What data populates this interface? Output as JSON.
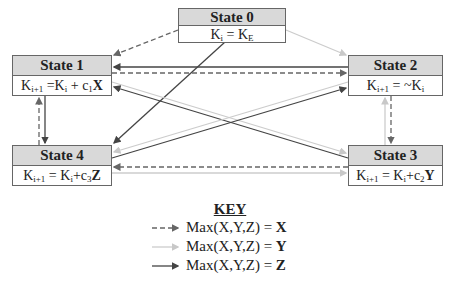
{
  "states": [
    {
      "id": "state-0",
      "title": "State 0",
      "formula": {
        "lhs": "K",
        "lhs_sub": "i",
        "op": " = ",
        "rhs": "K",
        "rhs_sub": "E",
        "coef": "",
        "coef_sub": "",
        "var": ""
      }
    },
    {
      "id": "state-1",
      "title": "State 1",
      "formula": {
        "lhs": "K",
        "lhs_sub": "i+1",
        "op": " =",
        "rhs": "K",
        "rhs_sub": "i",
        "plus": " + c",
        "coef_sub": "1",
        "var": "X"
      }
    },
    {
      "id": "state-2",
      "title": "State 2",
      "formula": {
        "lhs": "K",
        "lhs_sub": "i+1",
        "op": " = ~",
        "rhs": "K",
        "rhs_sub": "i",
        "plus": "",
        "coef_sub": "",
        "var": ""
      }
    },
    {
      "id": "state-3",
      "title": "State 3",
      "formula": {
        "lhs": "K",
        "lhs_sub": "i+1",
        "op": " = ",
        "rhs": "K",
        "rhs_sub": "i",
        "plus": "+c",
        "coef_sub": "2",
        "var": "Y"
      }
    },
    {
      "id": "state-4",
      "title": "State 4",
      "formula": {
        "lhs": "K",
        "lhs_sub": "i+1",
        "op": " = ",
        "rhs": "K",
        "rhs_sub": "i",
        "plus": "+c",
        "coef_sub": "3",
        "var": "Z"
      }
    }
  ],
  "transitions": [
    {
      "from": "State 0",
      "to": "State 1",
      "type": "X"
    },
    {
      "from": "State 0",
      "to": "State 2",
      "type": "Y"
    },
    {
      "from": "State 0",
      "to": "State 4",
      "type": "Z"
    },
    {
      "from": "State 2",
      "to": "State 1",
      "type": "Z"
    },
    {
      "from": "State 1",
      "to": "State 2",
      "type": "X"
    },
    {
      "from": "State 1",
      "to": "State 3",
      "type": "Y"
    },
    {
      "from": "State 3",
      "to": "State 1",
      "type": "Z"
    },
    {
      "from": "State 2",
      "to": "State 4",
      "type": "Y"
    },
    {
      "from": "State 4",
      "to": "State 2",
      "type": "Z"
    },
    {
      "from": "State 1",
      "to": "State 4",
      "type": "Z"
    },
    {
      "from": "State 4",
      "to": "State 1",
      "type": "X"
    },
    {
      "from": "State 2",
      "to": "State 3",
      "type": "X"
    },
    {
      "from": "State 3",
      "to": "State 2",
      "type": "Y"
    },
    {
      "from": "State 3",
      "to": "State 4",
      "type": "X"
    },
    {
      "from": "State 4",
      "to": "State 3",
      "type": "Y"
    }
  ],
  "key": {
    "title": "KEY",
    "entries": [
      {
        "style": "dashed",
        "label": "Max(X,Y,Z) = ",
        "var": "X"
      },
      {
        "style": "light",
        "label": "Max(X,Y,Z) = ",
        "var": "Y"
      },
      {
        "style": "solid",
        "label": "Max(X,Y,Z) = ",
        "var": "Z"
      }
    ]
  },
  "colors": {
    "dashed": "#666666",
    "light": "#cccccc",
    "solid": "#444444",
    "header_fill": "#d9d9d9",
    "border": "#666666"
  }
}
